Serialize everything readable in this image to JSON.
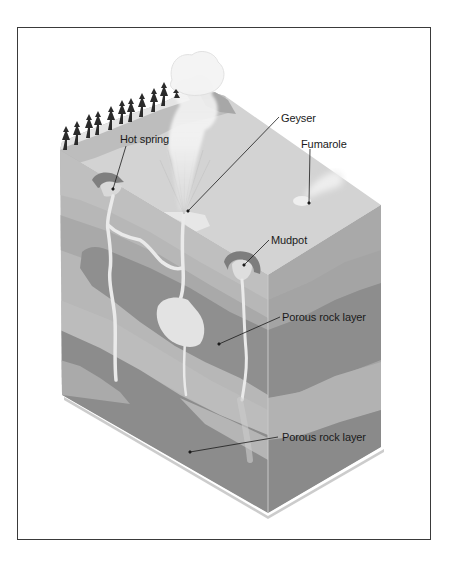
{
  "diagram": {
    "labels": {
      "hot_spring": "Hot spring",
      "geyser": "Geyser",
      "fumarole": "Fumarole",
      "mudpot": "Mudpot",
      "porous_rock_upper": "Porous rock layer",
      "porous_rock_lower": "Porous rock layer"
    },
    "colors": {
      "frame_border": "#3a3a3a",
      "top_surface": "#d2d2d2",
      "rock_light": "#b9b9b9",
      "rock_mid": "#a6a6a6",
      "porous_dark": "#8f8f8f",
      "right_face_light": "#b0b0b0",
      "right_face_dark": "#8a8a8a",
      "water_channel": "#ececec",
      "steam": "#f1f1f1",
      "trees": "#2a2a2a",
      "leader_line": "#1a1a1a"
    }
  }
}
